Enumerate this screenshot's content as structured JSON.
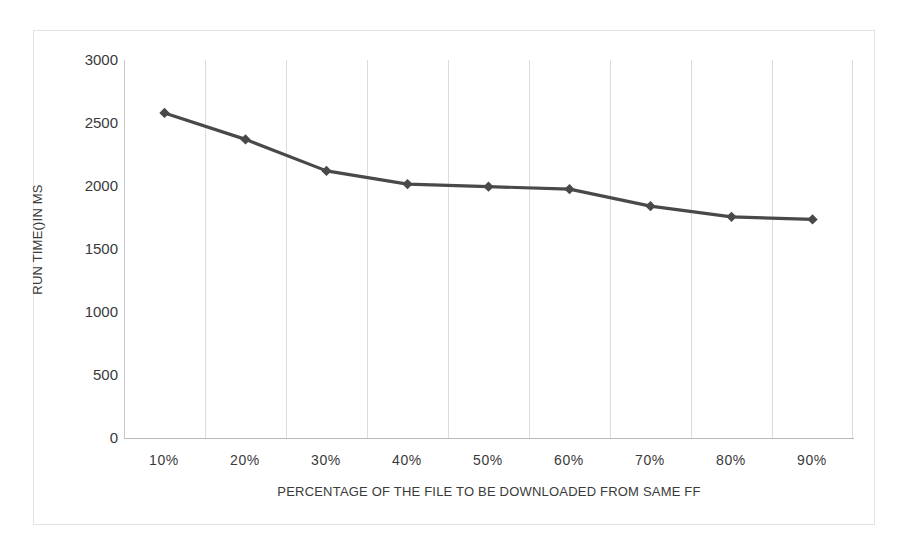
{
  "chart_data": {
    "type": "line",
    "title": "",
    "xlabel": "PERCENTAGE OF THE FILE TO BE DOWNLOADED FROM SAME FF",
    "ylabel": "RUN TIME()IN MS",
    "categories": [
      "10%",
      "20%",
      "30%",
      "40%",
      "50%",
      "60%",
      "70%",
      "80%",
      "90%"
    ],
    "values": [
      2580,
      2370,
      2120,
      2015,
      1995,
      1975,
      1840,
      1755,
      1735
    ],
    "series": [
      {
        "name": "Run time",
        "values": [
          2580,
          2370,
          2120,
          2015,
          1995,
          1975,
          1840,
          1755,
          1735
        ]
      }
    ],
    "ylim": [
      0,
      3000
    ],
    "y_ticks": [
      "3000",
      "2500",
      "2000",
      "1500",
      "1000",
      "500",
      "0"
    ],
    "y_tick_values": [
      3000,
      2500,
      2000,
      1500,
      1000,
      500,
      0
    ],
    "x_ticks": [
      "10%",
      "20%",
      "30%",
      "40%",
      "50%",
      "60%",
      "70%",
      "80%",
      "90%"
    ],
    "grid": "vertical",
    "legend": "none",
    "marker": "diamond",
    "series_color": "#494949",
    "grid_color": "#dcdcdc",
    "axis_color": "#b9b9b9",
    "text_color": "#3a3a3a",
    "background": "#ffffff"
  }
}
